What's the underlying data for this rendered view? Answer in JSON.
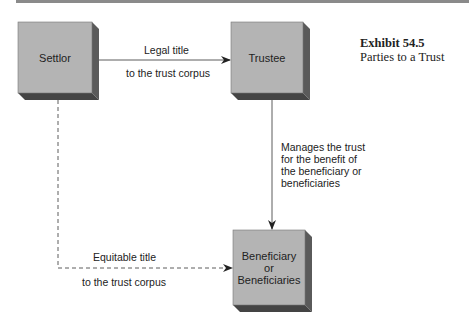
{
  "exhibit": {
    "title": "Exhibit 54.5",
    "subtitle": "Parties to a Trust"
  },
  "nodes": {
    "settlor": "Settlor",
    "trustee": "Trustee",
    "beneficiary": [
      "Beneficiary",
      "or",
      "Beneficiaries"
    ]
  },
  "edges": {
    "legal_title": {
      "above": "Legal title",
      "below": "to the trust corpus"
    },
    "manages": [
      "Manages the trust",
      "for the benefit of",
      "the beneficiary or",
      "beneficiaries"
    ],
    "equitable_title": {
      "above": "Equitable title",
      "below": "to the trust corpus"
    }
  },
  "colors": {
    "box_face": "#b4b4b4",
    "box_side": "#5a5a5a",
    "box_bottom": "#444444",
    "line": "#333333"
  }
}
